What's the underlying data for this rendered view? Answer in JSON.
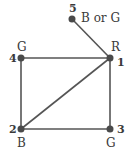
{
  "graph": {
    "nodes": [
      {
        "id": "1",
        "label": "1",
        "color_label": "R"
      },
      {
        "id": "2",
        "label": "2",
        "color_label": "B"
      },
      {
        "id": "3",
        "label": "3",
        "color_label": "G"
      },
      {
        "id": "4",
        "label": "4",
        "color_label": "G"
      },
      {
        "id": "5",
        "label": "5",
        "color_label": "B or G"
      }
    ],
    "edges": [
      [
        "1",
        "5"
      ],
      [
        "1",
        "4"
      ],
      [
        "1",
        "2"
      ],
      [
        "1",
        "3"
      ],
      [
        "4",
        "2"
      ],
      [
        "2",
        "3"
      ]
    ],
    "colors": {
      "stroke": "#555555",
      "node": "#4a4a4a"
    }
  }
}
